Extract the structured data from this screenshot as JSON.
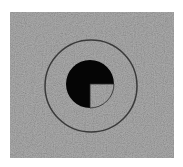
{
  "stimulus": {
    "background_color": "#8e8e8e",
    "page_color": "#ffffff",
    "ring": {
      "color": "#3a3a3a",
      "cx": 91,
      "cy": 86,
      "r": 46,
      "stroke_width": 1.5
    },
    "disc": {
      "color": "#050505",
      "cx": 90,
      "cy": 84,
      "r": 24,
      "missing_quadrant": "bottom-right"
    }
  }
}
